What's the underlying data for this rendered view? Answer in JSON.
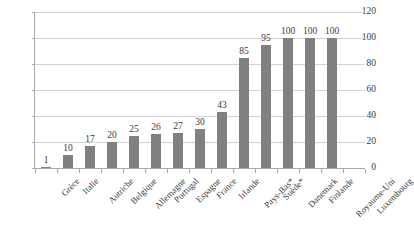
{
  "chart_data": {
    "type": "bar",
    "title": "",
    "subtitle": "",
    "xlabel": "",
    "ylabel": "",
    "ylim": [
      0,
      120
    ],
    "ytick_interval": 20,
    "yticks": [
      "0",
      "20",
      "40",
      "60",
      "80",
      "100",
      "120"
    ],
    "grid": true,
    "grid_axis": "y",
    "legend": false,
    "legend_position": "none",
    "orientation": "vertical",
    "bar_color": "#808080",
    "grid_color": "#d2d2d2",
    "axis_color": "#a8a8a8",
    "text_color": "#3a3a3a",
    "categories": [
      "Grèce",
      "Italie",
      "Autriche",
      "Belgique",
      "Allemagne",
      "Portugal",
      "Espagne",
      "France",
      "Irlande",
      "Pays-Bas*",
      "Suède*",
      "Danemark",
      "Finlande",
      "Royaume-Uni",
      "Luxembourg"
    ],
    "values": [
      1,
      10,
      17,
      20,
      25,
      26,
      27,
      30,
      43,
      85,
      95,
      100,
      100,
      100,
      null
    ],
    "data_labels": [
      "1",
      "10",
      "17",
      "20",
      "25",
      "26",
      "27",
      "30",
      "43",
      "85",
      "95",
      "100",
      "100",
      "100",
      ""
    ]
  },
  "axes": {
    "y": {
      "ticks": [
        {
          "label": "120",
          "value": 120
        },
        {
          "label": "100",
          "value": 100
        },
        {
          "label": "80",
          "value": 80
        },
        {
          "label": "60",
          "value": 60
        },
        {
          "label": "40",
          "value": 40
        },
        {
          "label": "20",
          "value": 20
        },
        {
          "label": "0",
          "value": 0
        }
      ]
    }
  },
  "title_remnant": "· · · ·"
}
